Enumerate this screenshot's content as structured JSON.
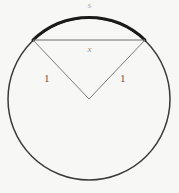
{
  "figure": {
    "background_color": "#f7f7f5",
    "labels": {
      "arc": "s",
      "chord": "x",
      "radius_left": "1",
      "radius_right": "1"
    },
    "colors": {
      "circle_stroke": "#3a3a38",
      "arc_highlight_stroke": "#1a1a18",
      "chord_stroke": "#6e6e6b",
      "radius_stroke": "#7a7a77",
      "label_arc": "#a9a9a6",
      "label_chord": "#8e8e8b",
      "label_radius": "#5b5b58"
    },
    "geometry": {
      "center_x": 89,
      "center_y": 99,
      "radius": 81,
      "chord_y": 40,
      "chord_left_x": 33,
      "chord_right_x": 145,
      "circle_stroke_width": 1.5,
      "arc_stroke_width": 3,
      "chord_stroke_width": 1,
      "radius_stroke_width": 1
    }
  }
}
